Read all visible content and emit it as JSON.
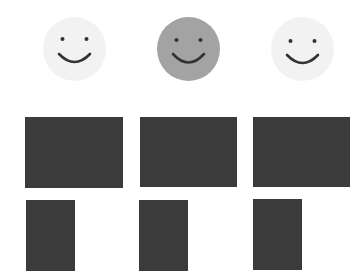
{
  "faces": [
    {
      "id": "face-1",
      "icon": "smiley-face-icon",
      "selected": false,
      "fill": "#f2f2f2",
      "x": 43,
      "y": 17
    },
    {
      "id": "face-2",
      "icon": "smiley-face-icon",
      "selected": true,
      "fill": "#a3a3a3",
      "x": 157,
      "y": 17
    },
    {
      "id": "face-3",
      "icon": "smiley-face-icon",
      "selected": false,
      "fill": "#f2f2f2",
      "x": 271,
      "y": 17
    }
  ],
  "feature_color": "#333333",
  "block_color": "#3b3b3b",
  "large_blocks": [
    {
      "x": 25,
      "y": 117,
      "w": 98,
      "h": 71
    },
    {
      "x": 140,
      "y": 117,
      "w": 97,
      "h": 70
    },
    {
      "x": 253,
      "y": 117,
      "w": 97,
      "h": 70
    }
  ],
  "small_blocks": [
    {
      "x": 26,
      "y": 200,
      "w": 49,
      "h": 71
    },
    {
      "x": 139,
      "y": 200,
      "w": 49,
      "h": 71
    },
    {
      "x": 253,
      "y": 199,
      "w": 49,
      "h": 71
    }
  ]
}
